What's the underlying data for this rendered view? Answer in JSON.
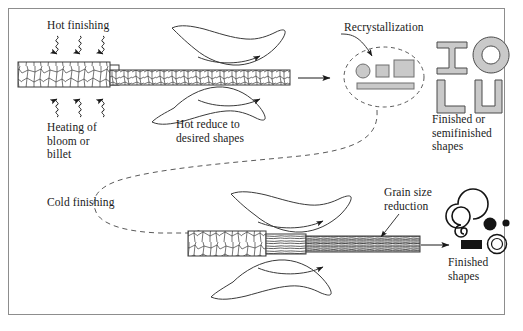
{
  "figure": {
    "background": "#ffffff",
    "border_color": "#8d8d8d",
    "ink_color": "#1a1a1a",
    "shape_fill": "#c9c9c9"
  },
  "labels": {
    "hot_finishing": "Hot finishing",
    "heating_of_bloom_or_billet": "Heating of\nbloom or\nbillet",
    "hot_reduce": "Hot reduce to\ndesired shapes",
    "recrystallization": "Recrystallization",
    "finished_or_semifinished": "Finished or\nsemifinished\nshapes",
    "cold_finishing": "Cold finishing",
    "grain_size_reduction": "Grain size\nreduction",
    "finished_shapes": "Finished\nshapes"
  },
  "icons": {
    "heat_arrow_down": "wavy-heat-arrow-down",
    "heat_arrow_up": "wavy-heat-arrow-up",
    "billet": "billet-rectangle",
    "roll_upper": "rolling-roll-upper",
    "roll_lower": "rolling-roll-lower",
    "rotation_arrow": "roll-rotation-arrow",
    "strip_coarse_grain": "coarse-grain-strip",
    "strip_fine_grain": "fine-grain-strip",
    "strip_fibrous_grain": "fibrous-elongated-grain-strip",
    "recrystallization_oval": "dashed-oval",
    "process_arrow": "process-flow-arrow",
    "dashed_path": "cold-finishing-dashed-path",
    "leader_line": "callout-leader-line"
  },
  "semifinished_shapes": [
    {
      "name": "i-beam",
      "label": "I"
    },
    {
      "name": "o-ring",
      "label": "O"
    },
    {
      "name": "l-angle",
      "label": "L"
    },
    {
      "name": "c-channel",
      "label": "C"
    }
  ],
  "recrystallized_products": [
    {
      "name": "round-bar",
      "shape": "circle"
    },
    {
      "name": "small-square-bar",
      "shape": "square"
    },
    {
      "name": "rectangular-bar",
      "shape": "rectangle"
    },
    {
      "name": "flat-plate",
      "shape": "bar"
    }
  ],
  "finished_products": [
    {
      "name": "coil",
      "shape": "spiral"
    },
    {
      "name": "large-rod",
      "shape": "filled-circle"
    },
    {
      "name": "small-rod",
      "shape": "filled-circle"
    },
    {
      "name": "flat-strip",
      "shape": "filled-rectangle"
    },
    {
      "name": "tube",
      "shape": "ring"
    }
  ]
}
